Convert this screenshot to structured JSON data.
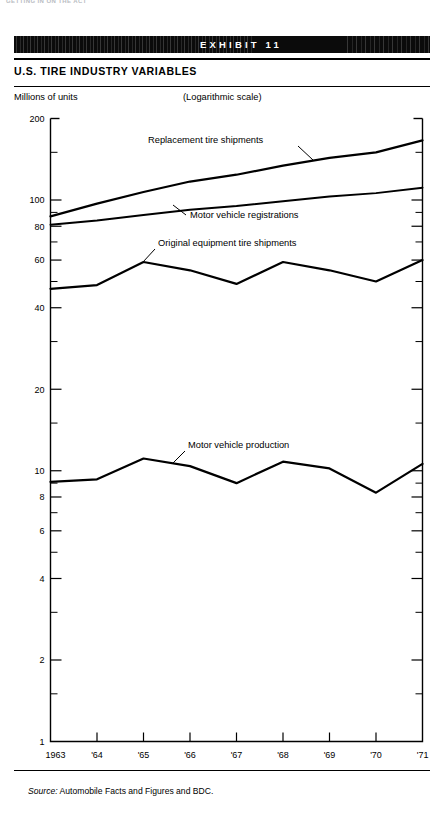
{
  "page": {
    "running_head": "GETTING IN ON THE ACT",
    "banner_label": "EXHIBIT 11",
    "title": "U.S. TIRE INDUSTRY VARIABLES",
    "unit_label": "Millions of units",
    "scale_note": "(Logarithmic scale)",
    "source_prefix": "Source:",
    "source_text": "Automobile Facts and Figures and BDC."
  },
  "chart_data": {
    "type": "line",
    "title": "U.S. TIRE INDUSTRY VARIABLES",
    "subtitle": "(Logarithmic scale)",
    "xlabel": "",
    "ylabel": "Millions of units",
    "scale": "log",
    "grid": false,
    "legend": "inline-annotations",
    "ylim": [
      1,
      200
    ],
    "ytick_labels": [
      "200",
      "100",
      "80",
      "60",
      "40",
      "20",
      "10",
      "8",
      "6",
      "4",
      "2",
      "1"
    ],
    "ytick_values": [
      200,
      100,
      80,
      60,
      40,
      20,
      10,
      8,
      6,
      4,
      2,
      1
    ],
    "yminor_values": [
      150,
      90,
      70,
      50,
      30,
      15,
      9,
      7,
      5,
      3,
      1.5
    ],
    "x": [
      1963,
      1964,
      1965,
      1966,
      1967,
      1968,
      1969,
      1970,
      1971
    ],
    "xtick_labels": [
      "1963",
      "'64",
      "'65",
      "'66",
      "'67",
      "'68",
      "'69",
      "'70",
      "'71"
    ],
    "series": [
      {
        "name": "Replacement tire shipments",
        "values": [
          87,
          97,
          107,
          117,
          124,
          134,
          143,
          150,
          166
        ]
      },
      {
        "name": "Motor vehicle registrations",
        "values": [
          81,
          84,
          88,
          92,
          95,
          99,
          103,
          106,
          111
        ]
      },
      {
        "name": "Original equipment tire shipments",
        "values": [
          47,
          48.5,
          59,
          55,
          49,
          59,
          55,
          50,
          60
        ]
      },
      {
        "name": "Motor vehicle production",
        "values": [
          9.1,
          9.3,
          11.1,
          10.4,
          9.0,
          10.8,
          10.2,
          8.3,
          10.6
        ]
      }
    ],
    "annotations": [
      {
        "text": "Replacement tire shipments",
        "x": 148,
        "y": 143
      },
      {
        "text": "Motor vehicle registrations",
        "x": 190,
        "y": 218
      },
      {
        "text": "Original equipment tire shipments",
        "x": 158,
        "y": 246
      },
      {
        "text": "Motor vehicle production",
        "x": 188,
        "y": 448
      }
    ]
  }
}
